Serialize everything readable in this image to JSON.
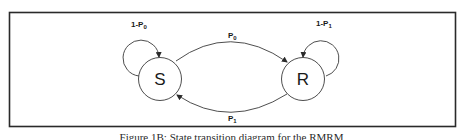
{
  "figure": {
    "nodes": [
      {
        "id": "S",
        "label": "S"
      },
      {
        "id": "R",
        "label": "R"
      }
    ],
    "edges": [
      {
        "from": "S",
        "to": "S",
        "label_main": "1-P",
        "label_sub": "0"
      },
      {
        "from": "S",
        "to": "R",
        "label_main": "P",
        "label_sub": "0"
      },
      {
        "from": "R",
        "to": "R",
        "label_main": "1-P",
        "label_sub": "1"
      },
      {
        "from": "R",
        "to": "S",
        "label_main": "P",
        "label_sub": "1"
      }
    ],
    "caption": "Figure 1B: State transition diagram for the RMRM"
  },
  "colors": {
    "line": "#3a3a3a",
    "frame": "#2a2a2a",
    "background": "#ffffff"
  }
}
